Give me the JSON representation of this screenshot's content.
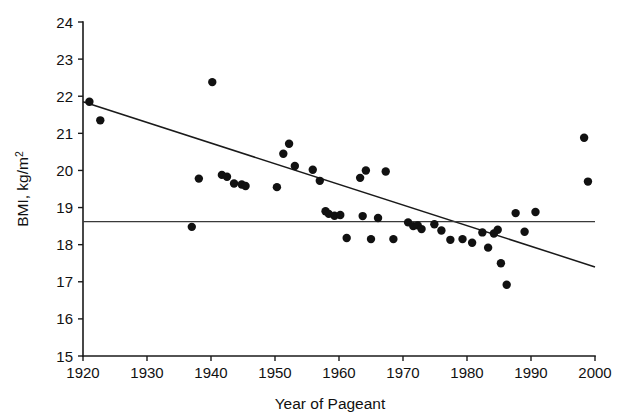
{
  "chart_data": {
    "type": "scatter",
    "title": "",
    "xlabel": "Year of Pageant",
    "ylabel": "BMI, kg/m2",
    "ylabel_main": "BMI, kg/m",
    "ylabel_exponent": "2",
    "xlim": [
      1920,
      2000
    ],
    "ylim": [
      15,
      24
    ],
    "xticks": [
      1920,
      1930,
      1940,
      1950,
      1960,
      1970,
      1980,
      1990,
      2000
    ],
    "xticklabels": [
      "1920",
      "1930",
      "1940",
      "1950",
      "1960",
      "1970",
      "1980",
      "1990",
      "2000"
    ],
    "yticks": [
      15,
      16,
      17,
      18,
      19,
      20,
      21,
      22,
      23,
      24
    ],
    "yticklabels": [
      "15",
      "16",
      "17",
      "18",
      "19",
      "20",
      "21",
      "22",
      "23",
      "24"
    ],
    "grid": false,
    "legend": "none",
    "marker": "filled-circle",
    "marker_color": "#111111",
    "point_radius": 4.2,
    "x": [
      1921.0,
      1922.7,
      1937.0,
      1938.1,
      1940.2,
      1941.7,
      1942.5,
      1943.6,
      1944.8,
      1945.4,
      1950.3,
      1951.3,
      1952.2,
      1953.1,
      1955.9,
      1957.0,
      1957.9,
      1958.4,
      1959.3,
      1960.2,
      1961.2,
      1963.3,
      1963.7,
      1964.2,
      1965.0,
      1966.1,
      1967.3,
      1968.5,
      1970.8,
      1971.6,
      1972.3,
      1972.9,
      1974.9,
      1976.0,
      1977.4,
      1979.3,
      1980.8,
      1982.4,
      1983.3,
      1984.2,
      1984.8,
      1985.3,
      1986.2,
      1987.6,
      1989.0,
      1990.7,
      1998.3,
      1998.9
    ],
    "y": [
      21.85,
      21.35,
      18.48,
      19.78,
      22.38,
      19.88,
      19.83,
      19.65,
      19.62,
      19.58,
      19.55,
      20.45,
      20.72,
      20.12,
      20.02,
      19.72,
      18.9,
      18.83,
      18.78,
      18.8,
      18.18,
      19.8,
      18.77,
      20.0,
      18.15,
      18.72,
      19.97,
      18.15,
      18.6,
      18.5,
      18.52,
      18.42,
      18.55,
      18.38,
      18.13,
      18.15,
      18.05,
      18.33,
      17.92,
      18.3,
      18.4,
      17.5,
      16.92,
      18.85,
      18.35,
      18.88,
      20.88,
      19.7
    ],
    "annotations": [
      {
        "kind": "regression-line",
        "label": "linear trend line",
        "x0": 1920.0,
        "y0": 21.85,
        "x1": 2000.0,
        "y1": 17.4
      },
      {
        "kind": "reference-line",
        "label": "horizontal reference line",
        "x0": 1920.0,
        "y0": 18.62,
        "x1": 2000.0,
        "y1": 18.62
      }
    ]
  },
  "figure": {
    "background_color": "#ffffff",
    "foreground_color": "#111111",
    "xlabel": "Year of Pageant",
    "ylabel_main": "BMI, kg/m",
    "ylabel_exponent": "2"
  }
}
